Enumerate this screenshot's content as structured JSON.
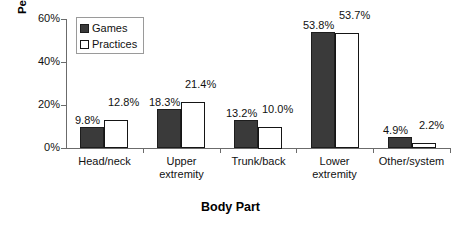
{
  "chart_data": {
    "type": "bar",
    "title": "",
    "xlabel": "Body Part",
    "ylabel": "Percentage of Injuries",
    "categories": [
      "Head/neck",
      "Upper extremity",
      "Trunk/back",
      "Lower extremity",
      "Other/system"
    ],
    "category_lines": [
      [
        "Head/neck"
      ],
      [
        "Upper",
        "extremity"
      ],
      [
        "Trunk/back"
      ],
      [
        "Lower",
        "extremity"
      ],
      [
        "Other/system"
      ]
    ],
    "series": [
      {
        "name": "Games",
        "color": "#3a3a3a",
        "values": [
          9.8,
          18.3,
          13.2,
          53.8,
          4.9
        ],
        "labels": [
          "9.8%",
          "18.3%",
          "13.2%",
          "53.8%",
          "4.9%"
        ]
      },
      {
        "name": "Practices",
        "color": "#ffffff",
        "values": [
          12.8,
          21.4,
          10.0,
          53.7,
          2.2
        ],
        "labels": [
          "12.8%",
          "21.4%",
          "10.0%",
          "53.7%",
          "2.2%"
        ]
      }
    ],
    "ylim": [
      0,
      60
    ],
    "yticks": [
      0,
      20,
      40,
      60
    ],
    "ytick_labels": [
      "0%",
      "20%",
      "40%",
      "60%"
    ],
    "grid": false,
    "legend_position": "upper left",
    "legend_entries": [
      "Games",
      "Practices"
    ]
  }
}
